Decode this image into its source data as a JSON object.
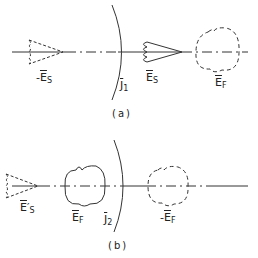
{
  "panels": [
    {
      "caption": "(a)",
      "surface_label": {
        "main": "J",
        "sub": "1"
      },
      "labels": [
        {
          "prefix": "-",
          "main": "E",
          "sub": "S",
          "note": "dashed source image (left)"
        },
        {
          "prefix": "",
          "main": "E",
          "sub": "S",
          "note": "solid source pattern"
        },
        {
          "prefix": "",
          "main": "E",
          "sub": "F",
          "note": "dashed feed pattern (right)"
        }
      ]
    },
    {
      "caption": "(b)",
      "surface_label": {
        "main": "J",
        "sub": "2"
      },
      "labels": [
        {
          "prefix": "",
          "main": "E",
          "sub": "S",
          "prime": "′",
          "note": "dashed source (left)"
        },
        {
          "prefix": "",
          "main": "E",
          "sub": "F",
          "note": "solid feed pattern"
        },
        {
          "prefix": "-",
          "main": "E",
          "sub": "F",
          "note": "dashed image (right)"
        }
      ]
    }
  ],
  "colors": {
    "line": "#333333",
    "background": "#ffffff"
  }
}
